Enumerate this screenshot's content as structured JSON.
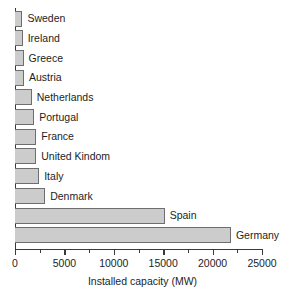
{
  "chart_data": {
    "type": "bar",
    "orientation": "horizontal",
    "title": "",
    "xlabel": "Installed capacity (MW)",
    "ylabel": "",
    "xlim": [
      0,
      25000
    ],
    "grid": false,
    "legend": null,
    "xticks": [
      0,
      5000,
      10000,
      15000,
      20000,
      25000
    ],
    "xtick_labels": [
      "0",
      "5000",
      "10000",
      "15000",
      "20000",
      "25000"
    ],
    "minor_tick_interval": 2500,
    "categories": [
      "Sweden",
      "Ireland",
      "Greece",
      "Austria",
      "Netherlands",
      "Portugal",
      "France",
      "United Kindom",
      "Italy",
      "Denmark",
      "Spain",
      "Germany"
    ],
    "values": [
      750,
      780,
      870,
      900,
      1700,
      1950,
      2150,
      2150,
      2450,
      3050,
      15150,
      21850
    ],
    "bar_fill_color": "#cccccc",
    "bar_border_color": "#6e6e6e",
    "axis_color": "#3a3a3a",
    "background_color": "#ffffff"
  }
}
